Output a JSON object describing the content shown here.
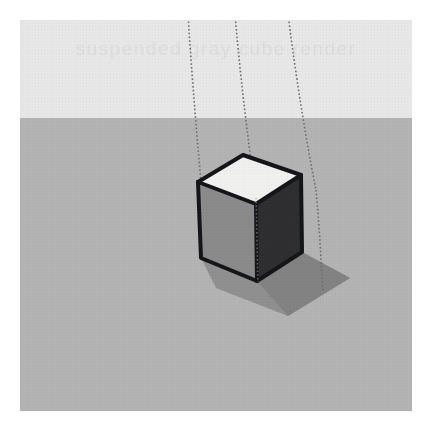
{
  "image": {
    "title": "Suspended gray cube with three dotted support strings",
    "kind": "3d-render",
    "width_px": 433,
    "height_px": 432
  },
  "watermark": {
    "text": "suspended gray cube render",
    "color": "#dededc",
    "visible": true
  },
  "background": {
    "page_color": "#ffffff",
    "margin_px": 20,
    "bands": [
      {
        "name": "sky",
        "color": "#e8e8e8",
        "top_px": 0,
        "height_px": 98
      },
      {
        "name": "ground",
        "color": "#b4b4b4",
        "top_px": 98,
        "height_px": 293
      }
    ],
    "horizon_y_px": 98
  },
  "strings": {
    "count": 3,
    "style": "dotted",
    "color": "#6e6e6e",
    "items": [
      {
        "name": "string-left",
        "top_x": 168,
        "top_y": -6,
        "bottom_x": 186,
        "bottom_y": 218
      },
      {
        "name": "string-middle",
        "top_x": 215,
        "top_y": -6,
        "bottom_x": 238,
        "bottom_y": 262
      },
      {
        "name": "string-right",
        "top_x": 268,
        "top_y": -6,
        "bottom_x": 300,
        "bottom_y": 270
      }
    ]
  },
  "cube": {
    "name": "gray-cube",
    "faces": [
      {
        "name": "top-face",
        "color": "#f1f1ef",
        "label": "top"
      },
      {
        "name": "left-face",
        "color": "#8b8b8b",
        "label": "left"
      },
      {
        "name": "right-face",
        "color": "#2f2f31",
        "label": "right"
      }
    ],
    "edge_color": "#15161a",
    "edge_width_px": 4,
    "vertices": {
      "top_back": [
        223,
        135
      ],
      "top_left": [
        178,
        162
      ],
      "top_right": [
        281,
        155
      ],
      "top_front": [
        236,
        184
      ],
      "bottom_left": [
        181,
        238
      ],
      "bottom_front": [
        237,
        261
      ],
      "bottom_right": [
        282,
        232
      ]
    }
  },
  "shadow": {
    "name": "cast-shadow",
    "color": "#8a8a8a",
    "direction": "lower-right",
    "opacity": 0.85
  }
}
